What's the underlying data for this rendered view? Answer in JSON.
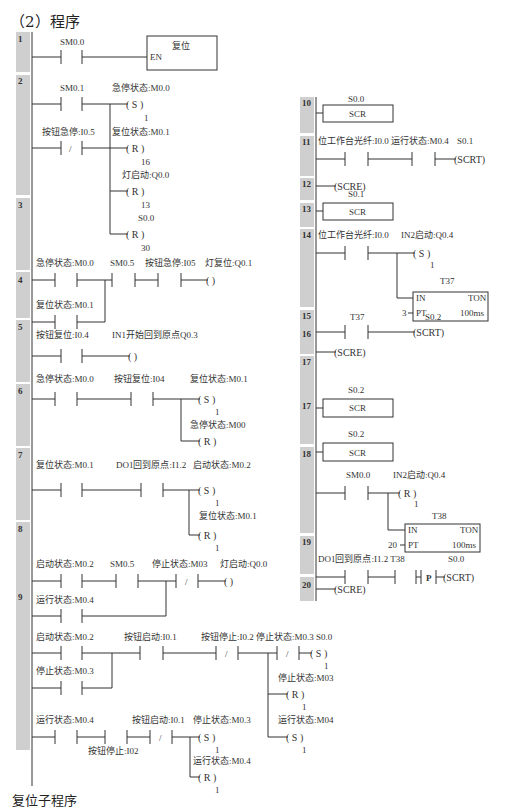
{
  "heading": "（2）程序",
  "footer": "复位子程序",
  "colors": {
    "rail_bar": "#cfcfcf",
    "line": "#333333",
    "text": "#333333"
  },
  "networks_left": [
    {
      "n": "1",
      "contacts": [
        "SM0.0"
      ],
      "box": {
        "title": "复位",
        "in": "EN"
      }
    },
    {
      "n": "2",
      "contacts": [
        "SM0.1",
        "按钮急停:I0.5 (NC)"
      ],
      "coils": [
        {
          "addr": "急停状态:M0.0",
          "op": "S",
          "n": "1"
        },
        {
          "addr": "复位状态:M0.1",
          "op": "R",
          "n": "16"
        },
        {
          "addr": "灯启动:Q0.0",
          "op": "R",
          "n": "13"
        },
        {
          "addr": "S0.0",
          "op": "R",
          "n": "30"
        }
      ]
    },
    {
      "n": "3",
      "contacts": [
        "急停状态:M0.0",
        "复位状态:M0.1",
        "SM0.5",
        "按钮急停:I0.5"
      ],
      "coils": [
        {
          "addr": "灯复位:Q0.1",
          "op": "",
          "n": ""
        }
      ]
    },
    {
      "n": "4",
      "contacts": [
        "按钮复位:I0.4"
      ],
      "coils": [
        {
          "addr": "IN1开始回到原点Q0.3",
          "op": "",
          "n": ""
        }
      ]
    },
    {
      "n": "5",
      "contacts": [
        "急停状态:M0.0",
        "按钮复位:I0.4"
      ],
      "coils": [
        {
          "addr": "复位状态:M0.1",
          "op": "S",
          "n": "1"
        },
        {
          "addr": "急停状态:M0.0",
          "op": "R",
          "n": "1"
        }
      ]
    },
    {
      "n": "6",
      "contacts": [
        "复位状态:M0.1",
        "DO1回到原点:I1.2"
      ],
      "coils": [
        {
          "addr": "启动状态:M0.2",
          "op": "S",
          "n": "1"
        },
        {
          "addr": "复位状态:M0.1",
          "op": "R",
          "n": "1"
        }
      ]
    },
    {
      "n": "7",
      "contacts": [
        "启动状态:M0.2",
        "运行状态:M0.4",
        "SM0.5",
        "停止状态:M0.3 (NC)"
      ],
      "coils": [
        {
          "addr": "灯启动:Q0.0",
          "op": "",
          "n": ""
        }
      ]
    },
    {
      "n": "8",
      "contacts": [
        "启动状态:M0.2",
        "停止状态:M0.3",
        "按钮启动:I0.1",
        "按钮停止:I0.2 (NC)",
        "停止状态:M0.3 (NC)"
      ],
      "coils": [
        {
          "addr": "S0.0",
          "op": "S",
          "n": "1"
        },
        {
          "addr": "停止状态:M0.3",
          "op": "R",
          "n": "1"
        },
        {
          "addr": "运行状态:M0.4",
          "op": "S",
          "n": "1"
        }
      ]
    },
    {
      "n": "9",
      "contacts": [
        "运行状态:M0.4",
        "按钮停止:I0.2",
        "按钮启动:I0.1 (NC)"
      ],
      "coils": [
        {
          "addr": "停止状态:M0.3",
          "op": "S",
          "n": "1"
        },
        {
          "addr": "运行状态:M0.4",
          "op": "R",
          "n": "1"
        }
      ]
    }
  ],
  "networks_right": [
    {
      "n": "10",
      "scr": "S0.0",
      "box": "SCR"
    },
    {
      "n": "11",
      "contacts": [
        "位工作台光纤:I0.0",
        "运行状态:M0.4"
      ],
      "coils": [
        {
          "addr": "S0.1",
          "op": "SCRT"
        }
      ]
    },
    {
      "n": "12",
      "coils": [
        {
          "op": "SCRE"
        }
      ]
    },
    {
      "n": "13",
      "scr": "S0.1",
      "box": "SCR"
    },
    {
      "n": "14",
      "contacts": [
        "位工作台光纤:I0.0"
      ],
      "coils": [
        {
          "addr": "IN2启动:Q0.4",
          "op": "S",
          "n": "1"
        }
      ],
      "timer": {
        "name": "T37",
        "type": "TON",
        "in": "IN",
        "pt": "PT",
        "preset": "3",
        "base": "100ms"
      }
    },
    {
      "n": "15",
      "contacts": [
        "T37"
      ],
      "coils": [
        {
          "addr": "S0.2",
          "op": "SCRT"
        }
      ]
    },
    {
      "n": "16",
      "coils": [
        {
          "op": "SCRE"
        }
      ]
    },
    {
      "n": "17",
      "scr": "S0.2",
      "box": "SCR"
    },
    {
      "n": "17",
      "scr": "S0.2",
      "box": "SCR"
    },
    {
      "n": "18",
      "contacts": [
        "SM0.0"
      ],
      "coils": [
        {
          "addr": "IN2启动:Q0.4",
          "op": "R",
          "n": "1"
        }
      ],
      "timer": {
        "name": "T38",
        "type": "TON",
        "in": "IN",
        "pt": "PT",
        "preset": "20",
        "base": "100ms"
      }
    },
    {
      "n": "19",
      "contacts": [
        "DO1回到原点:I1.2",
        "T38",
        "P"
      ],
      "coils": [
        {
          "addr": "S0.0",
          "op": "SCRT"
        }
      ]
    },
    {
      "n": "20",
      "coils": [
        {
          "op": "SCRE"
        }
      ]
    }
  ]
}
